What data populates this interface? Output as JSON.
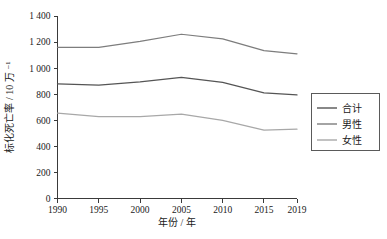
{
  "chart_data": {
    "type": "line",
    "title": "",
    "xlabel": "年份 / 年",
    "ylabel": "标化死亡率 / 10 万 ⁻¹",
    "x": [
      1990,
      1995,
      2000,
      2005,
      2010,
      2015,
      2019
    ],
    "categories": [
      "1990",
      "1995",
      "2000",
      "2005",
      "2010",
      "2015",
      "2019"
    ],
    "xlim": [
      1990,
      2019
    ],
    "ylim": [
      0,
      1400
    ],
    "yticks": [
      0,
      200,
      400,
      600,
      800,
      1000,
      1200,
      1400
    ],
    "ytick_labels": [
      "0",
      "200",
      "400",
      "600",
      "800",
      "1 000",
      "1 200",
      "1 400"
    ],
    "xtick_labels": [
      "1990",
      "1995",
      "2000",
      "2005",
      "2010",
      "2015",
      "2019"
    ],
    "grid": false,
    "legend_position": "right",
    "series": [
      {
        "name": "合计",
        "color": "#555555",
        "values": [
          880,
          870,
          895,
          930,
          890,
          810,
          795
        ]
      },
      {
        "name": "男性",
        "color": "#7d7d7d",
        "values": [
          1160,
          1160,
          1205,
          1260,
          1225,
          1135,
          1110
        ]
      },
      {
        "name": "女性",
        "color": "#a8a8a8",
        "values": [
          655,
          628,
          628,
          648,
          600,
          525,
          532
        ]
      }
    ]
  },
  "legend": {
    "items": [
      {
        "label": "合计"
      },
      {
        "label": "男性"
      },
      {
        "label": "女性"
      }
    ]
  },
  "axes": {
    "x_title": "年份 / 年",
    "y_title": "标化死亡率 / 10 万 ⁻¹"
  }
}
